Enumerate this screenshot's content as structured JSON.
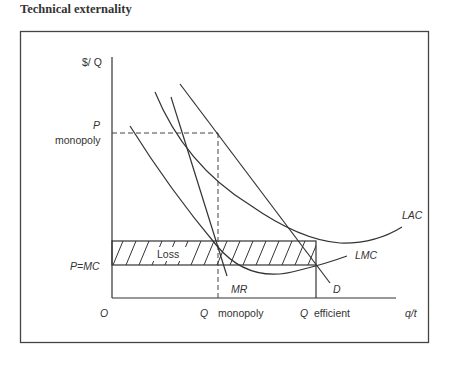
{
  "title": "Technical externality",
  "diagram": {
    "y_axis_label": "$/ Q",
    "x_axis_label": "q/t",
    "origin_label": "O",
    "price_monopoly_label_1": "P",
    "price_monopoly_label_2": "monopoly",
    "price_mc_label": "P=MC",
    "loss_label": "Loss",
    "q_monopoly_label_q": "Q",
    "q_monopoly_label_text": "monopoly",
    "q_efficient_label_q": "Q",
    "q_efficient_label_text": "efficient",
    "curves": {
      "mr": "MR",
      "d": "D",
      "lac": "LAC",
      "lmc": "LMC"
    },
    "colors": {
      "line": "#3a3a3a",
      "frame": "#444444",
      "background": "#ffffff"
    }
  }
}
